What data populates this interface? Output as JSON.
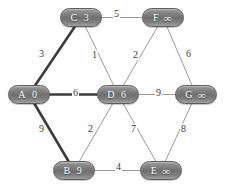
{
  "diagram": {
    "colors": {
      "node_fill": "#7a7a7a",
      "node_border": "#5d5d5d",
      "node_text": "#ffffff",
      "edge_normal": "#9a9a9a",
      "edge_highlight": "#3c3c3c",
      "label_text": "#3a3a3a",
      "background": "#ffffff"
    },
    "nodes": [
      {
        "key": "C",
        "id": "C",
        "distance": "3",
        "x": 60,
        "y": 8,
        "infinite": false
      },
      {
        "key": "F",
        "id": "F",
        "distance": "∞",
        "x": 142,
        "y": 8,
        "infinite": true
      },
      {
        "key": "A",
        "id": "A",
        "distance": "0",
        "x": 8,
        "y": 85,
        "infinite": false
      },
      {
        "key": "D",
        "id": "D",
        "distance": "6",
        "x": 97,
        "y": 85,
        "infinite": false
      },
      {
        "key": "G",
        "id": "G",
        "distance": "∞",
        "x": 175,
        "y": 85,
        "infinite": true
      },
      {
        "key": "B",
        "id": "B",
        "distance": "9",
        "x": 53,
        "y": 161,
        "infinite": false
      },
      {
        "key": "E",
        "id": "E",
        "distance": "∞",
        "x": 140,
        "y": 161,
        "infinite": true
      }
    ],
    "edges": [
      {
        "key": "C-F",
        "from": "C",
        "to": "F",
        "weight": "5",
        "highlight": false,
        "lx": 113,
        "ly": 9
      },
      {
        "key": "A-C",
        "from": "A",
        "to": "C",
        "weight": "3",
        "highlight": true,
        "lx": 38,
        "ly": 49
      },
      {
        "key": "C-D",
        "from": "C",
        "to": "D",
        "weight": "1",
        "highlight": false,
        "lx": 91,
        "ly": 50
      },
      {
        "key": "D-F",
        "from": "D",
        "to": "F",
        "weight": "2",
        "highlight": false,
        "lx": 132,
        "ly": 50
      },
      {
        "key": "F-G",
        "from": "F",
        "to": "G",
        "weight": "6",
        "highlight": false,
        "lx": 185,
        "ly": 49
      },
      {
        "key": "A-D",
        "from": "A",
        "to": "D",
        "weight": "6",
        "highlight": true,
        "lx": 72,
        "ly": 88
      },
      {
        "key": "D-G",
        "from": "D",
        "to": "G",
        "weight": "9",
        "highlight": false,
        "lx": 155,
        "ly": 88
      },
      {
        "key": "A-B",
        "from": "A",
        "to": "B",
        "weight": "9",
        "highlight": true,
        "lx": 38,
        "ly": 124
      },
      {
        "key": "B-D",
        "from": "B",
        "to": "D",
        "weight": "2",
        "highlight": false,
        "lx": 87,
        "ly": 124
      },
      {
        "key": "D-E",
        "from": "D",
        "to": "E",
        "weight": "7",
        "highlight": false,
        "lx": 130,
        "ly": 124
      },
      {
        "key": "E-G",
        "from": "E",
        "to": "G",
        "weight": "8",
        "highlight": false,
        "lx": 180,
        "ly": 124
      },
      {
        "key": "B-E",
        "from": "B",
        "to": "E",
        "weight": "4",
        "highlight": false,
        "lx": 115,
        "ly": 162
      }
    ]
  },
  "chart_data": {
    "type": "diagram",
    "subtype": "weighted-undirected-graph",
    "nodes": [
      "A",
      "B",
      "C",
      "D",
      "E",
      "F",
      "G"
    ],
    "node_distances": {
      "A": "0",
      "B": "9",
      "C": "3",
      "D": "6",
      "E": "∞",
      "F": "∞",
      "G": "∞"
    },
    "edges": [
      {
        "u": "A",
        "v": "C",
        "w": 3,
        "highlighted": true
      },
      {
        "u": "A",
        "v": "D",
        "w": 6,
        "highlighted": true
      },
      {
        "u": "A",
        "v": "B",
        "w": 9,
        "highlighted": true
      },
      {
        "u": "C",
        "v": "F",
        "w": 5,
        "highlighted": false
      },
      {
        "u": "C",
        "v": "D",
        "w": 1,
        "highlighted": false
      },
      {
        "u": "D",
        "v": "F",
        "w": 2,
        "highlighted": false
      },
      {
        "u": "F",
        "v": "G",
        "w": 6,
        "highlighted": false
      },
      {
        "u": "D",
        "v": "G",
        "w": 9,
        "highlighted": false
      },
      {
        "u": "B",
        "v": "D",
        "w": 2,
        "highlighted": false
      },
      {
        "u": "D",
        "v": "E",
        "w": 7,
        "highlighted": false
      },
      {
        "u": "E",
        "v": "G",
        "w": 8,
        "highlighted": false
      },
      {
        "u": "B",
        "v": "E",
        "w": 4,
        "highlighted": false
      }
    ]
  }
}
